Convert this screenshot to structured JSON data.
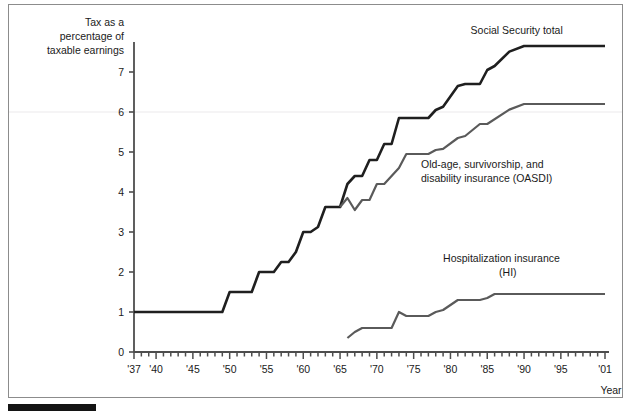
{
  "figure": {
    "axis_title_y_lines": [
      "Tax as a",
      "percentage of",
      "taxable earnings"
    ],
    "axis_title_x": "Year",
    "y_ticks": [
      "0",
      "1",
      "2",
      "3",
      "4",
      "5",
      "6",
      "7"
    ],
    "x_ticks": [
      "'37",
      "'40",
      "'45",
      "'50",
      "'55",
      "'60",
      "'65",
      "'70",
      "'75",
      "'80",
      "'85",
      "'90",
      "'95",
      "'01"
    ],
    "series_labels": {
      "total": "Social Security total",
      "oasdi_line1": "Old-age, survivorship, and",
      "oasdi_line2": "disability insurance (OASDI)",
      "hi_line1": "Hospitalization insurance",
      "hi_line2": "(HI)"
    },
    "colors": {
      "total": "#1f1f1f",
      "oasdi": "#5a5a5a",
      "hi": "#5a5a5a",
      "axis": "#4d4d4d",
      "frame": "#8c8c8c",
      "gridline": "#f2f0f2",
      "bar": "#141414"
    }
  },
  "chart_data": {
    "type": "line",
    "title": "",
    "subtitle": "",
    "xlabel": "Year",
    "ylabel": "Tax as a percentage of taxable earnings",
    "xlim": [
      1937,
      2001
    ],
    "ylim": [
      0,
      7.9
    ],
    "grid": false,
    "gridlines_y": [
      6
    ],
    "legend": "inline-annotations",
    "x_tick_labels": [
      "'37",
      "'40",
      "'45",
      "'50",
      "'55",
      "'60",
      "'65",
      "'70",
      "'75",
      "'80",
      "'85",
      "'90",
      "'95",
      "'01"
    ],
    "x_tick_values": [
      1937,
      1940,
      1945,
      1950,
      1955,
      1960,
      1965,
      1970,
      1975,
      1980,
      1985,
      1990,
      1995,
      2001
    ],
    "x_minor_tick_interval": 1,
    "y_tick_values": [
      0,
      1,
      2,
      3,
      4,
      5,
      6,
      7
    ],
    "series": [
      {
        "name": "Social Security total",
        "color": "#1f1f1f",
        "x": [
          1937,
          1949,
          1950,
          1953,
          1954,
          1956,
          1957,
          1958,
          1959,
          1960,
          1961,
          1962,
          1963,
          1965,
          1966,
          1967,
          1968,
          1969,
          1970,
          1971,
          1972,
          1973,
          1974,
          1977,
          1978,
          1979,
          1981,
          1982,
          1984,
          1985,
          1986,
          1988,
          1990,
          2001
        ],
        "y": [
          1.0,
          1.0,
          1.5,
          1.5,
          2.0,
          2.0,
          2.25,
          2.25,
          2.5,
          3.0,
          3.0,
          3.125,
          3.625,
          3.625,
          4.2,
          4.4,
          4.4,
          4.8,
          4.8,
          5.2,
          5.2,
          5.85,
          5.85,
          5.85,
          6.05,
          6.13,
          6.65,
          6.7,
          6.7,
          7.05,
          7.15,
          7.51,
          7.65,
          7.65
        ],
        "label_x": 1989,
        "label_y": 7.95
      },
      {
        "name": "Old-age, survivorship, and disability insurance (OASDI)",
        "color": "#5a5a5a",
        "x": [
          1965,
          1966,
          1967,
          1968,
          1969,
          1970,
          1971,
          1973,
          1974,
          1977,
          1978,
          1979,
          1981,
          1982,
          1984,
          1985,
          1988,
          1990,
          2001
        ],
        "y": [
          3.625,
          3.85,
          3.55,
          3.8,
          3.8,
          4.2,
          4.2,
          4.6,
          4.95,
          4.95,
          5.05,
          5.08,
          5.35,
          5.4,
          5.7,
          5.7,
          6.06,
          6.2,
          6.2
        ],
        "label_x": 1976,
        "label_y": 4.6
      },
      {
        "name": "Hospitalization insurance (HI)",
        "color": "#5a5a5a",
        "x": [
          1966,
          1967,
          1968,
          1971,
          1972,
          1973,
          1974,
          1977,
          1978,
          1979,
          1981,
          1982,
          1984,
          1985,
          1986,
          1988,
          1990,
          2001
        ],
        "y": [
          0.35,
          0.5,
          0.6,
          0.6,
          0.6,
          1.0,
          0.9,
          0.9,
          1.0,
          1.05,
          1.3,
          1.3,
          1.3,
          1.35,
          1.45,
          1.45,
          1.45,
          1.45
        ],
        "label_x": 1979,
        "label_y": 2.25
      }
    ]
  }
}
